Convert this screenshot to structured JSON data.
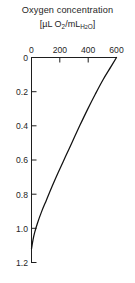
{
  "figure": {
    "title": "Oxygen concentration",
    "subtitle_prefix": "[µL O",
    "subtitle_o2_sub": "2",
    "subtitle_mid": "/mL",
    "subtitle_h2o_h": "H",
    "subtitle_h2o_2": "2",
    "subtitle_h2o_o": "O",
    "subtitle_suffix": "]",
    "caption": ""
  },
  "chart_data": {
    "type": "line",
    "title": "Oxygen concentration",
    "xlabel": "[µL O2/mL H2O]",
    "ylabel": "",
    "xlim": [
      0,
      600
    ],
    "ylim": [
      1.2,
      0
    ],
    "x_axis_position": "top",
    "y_axis_inverted": true,
    "grid": false,
    "legend": null,
    "xticks": [
      0,
      200,
      400,
      600
    ],
    "xtick_labels": [
      "0",
      "200",
      "400",
      "600"
    ],
    "yticks": [
      0,
      0.2,
      0.4,
      0.6,
      0.8,
      1.0,
      1.2
    ],
    "ytick_labels": [
      "0",
      "0.2",
      "0.4",
      "0.6",
      "0.8",
      "1.0",
      "1.2"
    ],
    "series": [
      {
        "name": "oxygen profile",
        "x": [
          600,
          560,
          505,
          450,
          395,
          340,
          290,
          240,
          190,
          145,
          105,
          70,
          42,
          22,
          10,
          4,
          0
        ],
        "y": [
          0.0,
          0.055,
          0.13,
          0.215,
          0.305,
          0.4,
          0.49,
          0.58,
          0.67,
          0.755,
          0.835,
          0.905,
          0.97,
          1.025,
          1.07,
          1.1,
          1.12
        ]
      }
    ]
  },
  "axes": {
    "x_tick_values": [
      "0",
      "200",
      "400",
      "600"
    ],
    "y_tick_values": [
      "0",
      "0.2",
      "0.4",
      "0.6",
      "0.8",
      "1.0",
      "1.2"
    ]
  }
}
